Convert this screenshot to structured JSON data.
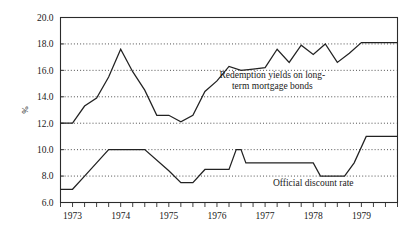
{
  "chart_data": {
    "type": "line",
    "title": "",
    "subtitle": "",
    "xlabel": "",
    "ylabel": "%",
    "ylim": [
      6.0,
      20.0
    ],
    "xlim": [
      1972.75,
      1979.75
    ],
    "ytick_step": 2.0,
    "grid": true,
    "grid_style": "dotted-horizontal",
    "legend_position": "inline-annotations",
    "ytick_labels": [
      "20.0",
      "18.0",
      "16.0",
      "14.0",
      "12.0",
      "10.0",
      "8.0",
      "6.0"
    ],
    "ytick_values": [
      20.0,
      18.0,
      16.0,
      14.0,
      12.0,
      10.0,
      8.0,
      6.0
    ],
    "xtick_labels": [
      "1973",
      "1974",
      "1975",
      "1976",
      "1977",
      "1978",
      "1979"
    ],
    "xtick_values": [
      1973,
      1974,
      1975,
      1976,
      1977,
      1978,
      1979
    ],
    "x_minor_tick_interval": 0.25,
    "series": [
      {
        "name": "Redemption yields on long-term mortgage bonds",
        "annotation": "Redemption yields on long-\nterm mortgage bonds",
        "annotation_line1": "Redemption yields on long-",
        "annotation_line2": "term mortgage bonds",
        "annotation_x": 1977.15,
        "annotation_y": 15.45,
        "color": "#222222",
        "x": [
          1972.75,
          1973.0,
          1973.25,
          1973.5,
          1973.75,
          1974.0,
          1974.25,
          1974.5,
          1974.75,
          1975.0,
          1975.25,
          1975.5,
          1975.75,
          1976.0,
          1976.25,
          1976.5,
          1976.75,
          1977.0,
          1977.25,
          1977.5,
          1977.75,
          1978.0,
          1978.25,
          1978.5,
          1978.75,
          1979.0,
          1979.25,
          1979.5,
          1979.75
        ],
        "values": [
          12.0,
          12.0,
          13.3,
          13.9,
          15.5,
          17.6,
          15.9,
          14.5,
          12.6,
          12.6,
          12.1,
          12.6,
          14.4,
          15.2,
          16.3,
          16.0,
          16.1,
          16.2,
          17.6,
          16.6,
          17.9,
          17.2,
          18.0,
          16.6,
          17.3,
          18.1,
          18.1,
          18.1,
          18.1
        ]
      },
      {
        "name": "Official discount rate",
        "annotation": "Official discount rate",
        "annotation_x": 1978.0,
        "annotation_y": 7.25,
        "color": "#222222",
        "x": [
          1972.75,
          1973.0,
          1973.25,
          1973.75,
          1974.5,
          1975.0,
          1975.25,
          1975.5,
          1975.75,
          1976.0,
          1976.25,
          1976.4,
          1976.5,
          1976.6,
          1976.75,
          1978.0,
          1978.15,
          1978.65,
          1978.85,
          1979.1,
          1979.75
        ],
        "values": [
          7.0,
          7.0,
          8.0,
          10.0,
          10.0,
          8.4,
          7.5,
          7.5,
          8.5,
          8.5,
          8.5,
          10.0,
          10.0,
          9.0,
          9.0,
          9.0,
          8.0,
          8.0,
          9.0,
          11.0,
          11.0
        ]
      }
    ]
  }
}
